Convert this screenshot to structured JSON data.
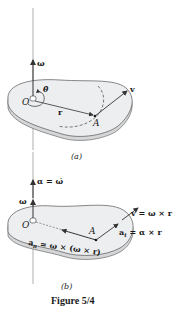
{
  "figure": {
    "caption": "Figure 5/4",
    "colors": {
      "disc_top": "#eceef0",
      "disc_edge": "#d4d6d8",
      "line": "#333333",
      "axis": "#888888",
      "background": "#ffffff"
    }
  },
  "panel_a": {
    "label": "(a)",
    "omega_label": "ω",
    "theta_dot_label": "θ̇",
    "origin_label": "O",
    "point_label": "A",
    "r_label": "r",
    "v_label": "v"
  },
  "panel_b": {
    "label": "(b)",
    "alpha_label": "α = ω̇",
    "omega_label": "ω",
    "origin_label": "O",
    "point_label": "A",
    "v_label": "v = ω × r",
    "at_label": "a",
    "at_sub": "t",
    "at_expr": " = α × r",
    "an_label": "a",
    "an_sub": "n",
    "an_expr": " = ω × (ω × r)"
  }
}
